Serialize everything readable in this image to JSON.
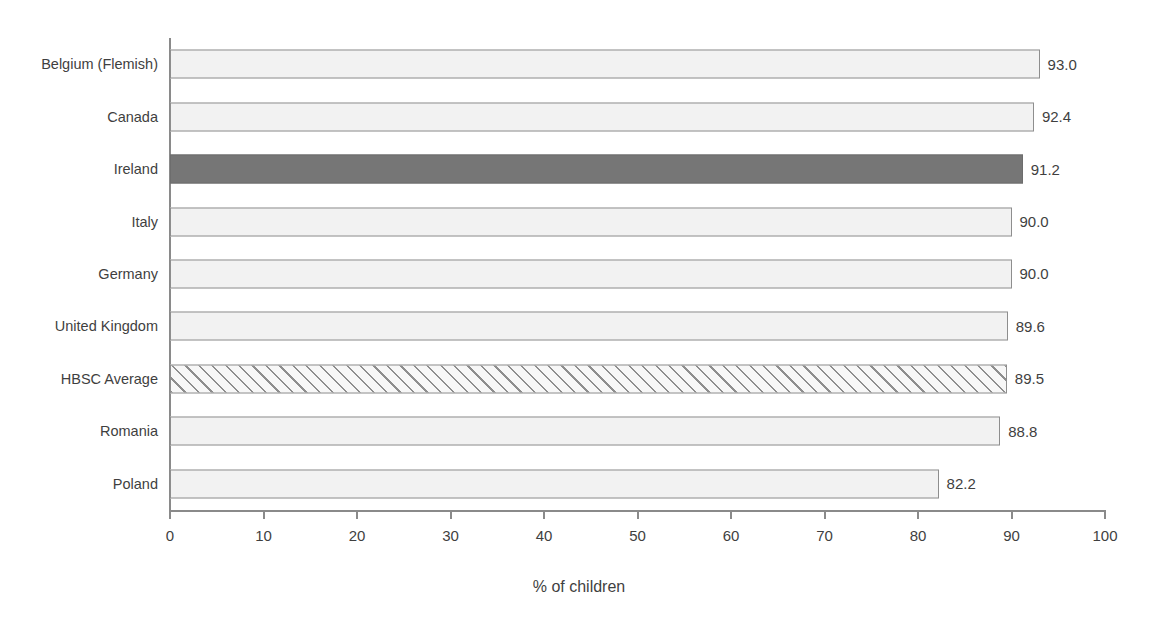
{
  "chart_data": {
    "type": "bar",
    "orientation": "horizontal",
    "title": "",
    "subtitle": "",
    "xlabel": "% of children",
    "ylabel": "",
    "xlim": [
      0,
      100
    ],
    "xticks": [
      0,
      10,
      20,
      30,
      40,
      50,
      60,
      70,
      80,
      90,
      100
    ],
    "xtick_labels": [
      "0",
      "10",
      "20",
      "30",
      "40",
      "50",
      "60",
      "70",
      "80",
      "90",
      "100"
    ],
    "grid": false,
    "legend": null,
    "categories": [
      "Belgium (Flemish)",
      "Canada",
      "Ireland",
      "Italy",
      "Germany",
      "United Kingdom",
      "HBSC Average",
      "Romania",
      "Poland"
    ],
    "values": [
      93.0,
      92.4,
      91.2,
      90.0,
      90.0,
      89.6,
      89.5,
      88.8,
      82.2
    ],
    "value_labels": [
      "93.0",
      "92.4",
      "91.2",
      "90.0",
      "90.0",
      "89.6",
      "89.5",
      "88.8",
      "82.2"
    ],
    "bar_styles": [
      "plain",
      "plain",
      "highlight",
      "plain",
      "plain",
      "plain",
      "hatched",
      "plain",
      "plain"
    ],
    "colors": {
      "bar_fill": "#f2f2f2",
      "bar_border": "#8e8e8e",
      "highlight_fill": "#767676",
      "hatch_fill": "#f7f7f7",
      "hatch_line": "#8e8e8e",
      "axis": "#8a8a8a",
      "text": "#3f3f3f",
      "background": "#ffffff"
    }
  }
}
